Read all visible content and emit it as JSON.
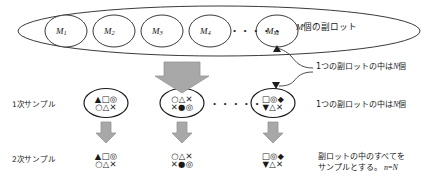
{
  "diagram": {
    "title_caption": "M個の副ロット",
    "lot_circles": [
      {
        "base": "M",
        "sub": "1"
      },
      {
        "base": "M",
        "sub": "2"
      },
      {
        "base": "M",
        "sub": "3"
      },
      {
        "base": "M",
        "sub": "4"
      },
      {
        "base": "M",
        "sub": "M"
      }
    ],
    "ellipsis_top": "• • • • •",
    "row_labels": {
      "primary": "1次サンプル",
      "secondary": "2次サンプル"
    },
    "annotations": {
      "sublot_n_top": "1つの副ロットの中はN個",
      "sublot_n_bottom": "1つの副ロットの中はN個",
      "all_sample_line1": "副ロットの中のすべてを",
      "all_sample_line2": "サンプルとする。",
      "all_sample_eq": "n=N"
    },
    "primary_samples": [
      {
        "top": "▲□◎",
        "bottom": "○△✕"
      },
      {
        "top": "○△✕",
        "bottom": "✕●◎"
      },
      {
        "top": "□◎◆",
        "bottom": "▼△✕"
      }
    ],
    "secondary_samples": [
      {
        "top": "▲□◎",
        "bottom": "○△✕"
      },
      {
        "top": "○△✕",
        "bottom": "✕●◎"
      },
      {
        "top": "□◎◆",
        "bottom": "▼△✕"
      }
    ],
    "ellipsis_middle": "• • • • •",
    "colors": {
      "line": "#3a3a3a",
      "arrow_fill": "#a8a8a8",
      "arrow_stroke": "#8f8f8f",
      "text": "#1a1a1a"
    }
  }
}
